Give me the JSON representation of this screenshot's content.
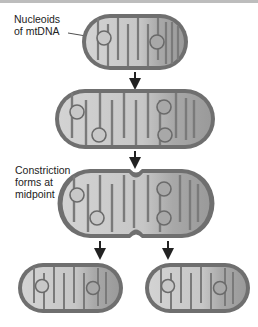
{
  "figure": {
    "type": "mitochondrial fission diagram",
    "labels": {
      "nucleoids": "Nucleoids\nof mtDNA",
      "constriction": "Constriction\nforms at\nmidpoint"
    },
    "stages": [
      {
        "id": "parent",
        "description": "Single mitochondrion with two nucleoids"
      },
      {
        "id": "elongated",
        "description": "Elongated mitochondrion with four nucleoids"
      },
      {
        "id": "constricted",
        "description": "Constriction forms at midpoint"
      },
      {
        "id": "daughters",
        "description": "Two daughter mitochondria each with two nucleoids"
      }
    ],
    "colors": {
      "outer_membrane": "#6b6b6b",
      "matrix_light": "#c9c9c9",
      "matrix_mid": "#a9a9a9",
      "cristae": "#7a7a7a",
      "arrow": "#222222",
      "text": "#222222"
    }
  }
}
